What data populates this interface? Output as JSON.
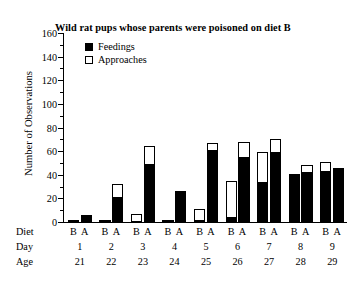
{
  "chart_data": {
    "type": "bar",
    "title": "Wild rat pups whose parents were poisoned on diet B",
    "xlabel": "",
    "ylabel": "Number of Observations",
    "ylim": [
      0,
      160
    ],
    "ytick_step": 20,
    "yminor_step": 10,
    "grid": false,
    "legend_position": "top-left",
    "stacked": true,
    "categories": [
      "1",
      "2",
      "3",
      "4",
      "5",
      "6",
      "7",
      "8",
      "9"
    ],
    "row_labels": {
      "diet": "Diet",
      "day": "Day",
      "age": "Age"
    },
    "diet_labels": [
      "B",
      "A"
    ],
    "days": [
      "1",
      "2",
      "3",
      "4",
      "5",
      "6",
      "7",
      "8",
      "9"
    ],
    "ages": [
      "21",
      "22",
      "23",
      "24",
      "25",
      "26",
      "27",
      "28",
      "29"
    ],
    "yticks": [
      "0",
      "20",
      "40",
      "60",
      "80",
      "100",
      "120",
      "140",
      "160"
    ],
    "legend": [
      {
        "name": "Feedings",
        "style": "filled",
        "color": "#000000"
      },
      {
        "name": "Approaches",
        "style": "open",
        "color": "#ffffff"
      }
    ],
    "series": [
      {
        "name": "Feedings",
        "diet_B": [
          2,
          2,
          1,
          2,
          2,
          4,
          34,
          40,
          43
        ],
        "diet_A": [
          6,
          21,
          49,
          26,
          61,
          55,
          59,
          42,
          46
        ]
      },
      {
        "name": "Approaches",
        "note": "total bar height (feedings + approaches)",
        "diet_B": [
          2,
          2,
          7,
          2,
          11,
          35,
          59,
          41,
          51
        ],
        "diet_A": [
          6,
          32,
          64,
          26,
          67,
          68,
          70,
          48,
          46
        ]
      }
    ]
  }
}
